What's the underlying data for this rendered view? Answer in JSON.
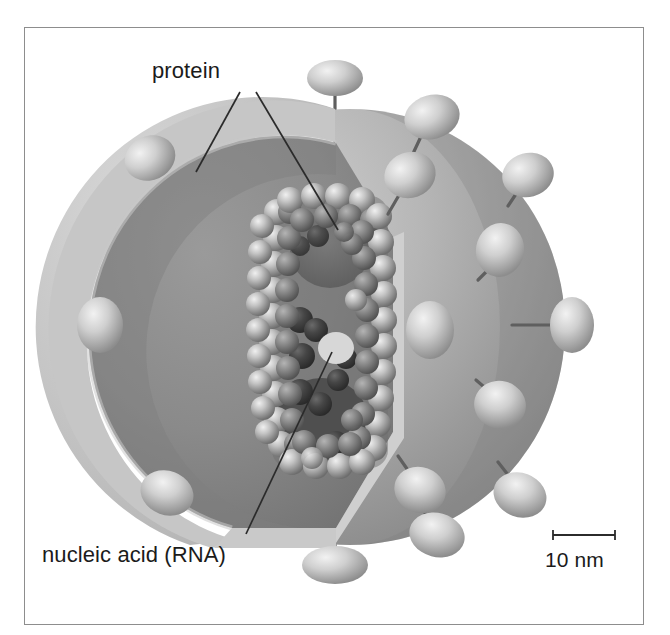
{
  "figure": {
    "background_color": "#ffffff",
    "frame_color": "#8d8d8d"
  },
  "labels": {
    "protein": "protein",
    "nucleic_acid": "nucleic acid (RNA)",
    "scale_bar": "10 nm"
  },
  "palette": {
    "envelope_light": "#c2c2c2",
    "envelope_shadow": "#9a9a9a",
    "outer_sphere_light": "#c9c9c9",
    "outer_sphere_dark": "#8f8f8f",
    "inner_cavity": "#8c8c8c",
    "inner_cavity_dark": "#6e6e6e",
    "capsid_sphere_light": "#e3e3e3",
    "capsid_sphere_dark": "#6a6a6a",
    "rna_dark": "#3d3d3d",
    "spike_light": "#ececec",
    "spike_dark": "#8a8a8a",
    "stalk": "#5a5a5a",
    "leader_line": "#2b2b2b",
    "text": "#1b1b1b"
  },
  "structure": {
    "parts": [
      "lipid envelope",
      "matrix / inner membrane layer",
      "helical nucleocapsid (protein subunits)",
      "nucleic acid (RNA) strand",
      "surface glycoprotein spikes"
    ],
    "cutaway": "quarter wedge removed from front-left to reveal interior"
  },
  "scale": {
    "bar_label": "10 nm",
    "bar_length_px": 62,
    "tick_height_px": 9
  },
  "spikes": [
    {
      "id": "spike-top",
      "cx": 335,
      "cy": 78,
      "rx": 28,
      "ry": 18,
      "angle": 0,
      "stalk_x2": 335,
      "stalk_y2": 150
    },
    {
      "id": "spike-upper-left",
      "cx": 150,
      "cy": 158,
      "rx": 26,
      "ry": 22,
      "angle": -25,
      "stalk_x2": 198,
      "stalk_y2": 196
    },
    {
      "id": "spike-upper-right",
      "cx": 432,
      "cy": 117,
      "rx": 28,
      "ry": 22,
      "angle": -15,
      "stalk_x2": 418,
      "stalk_y2": 162
    },
    {
      "id": "spike-ur2",
      "cx": 410,
      "cy": 175,
      "rx": 26,
      "ry": 23,
      "angle": -20,
      "stalk_x2": 392,
      "stalk_y2": 212
    },
    {
      "id": "spike-right-top",
      "cx": 528,
      "cy": 175,
      "rx": 26,
      "ry": 22,
      "angle": -15,
      "stalk_x2": 511,
      "stalk_y2": 190
    },
    {
      "id": "spike-right-mid",
      "cx": 500,
      "cy": 250,
      "rx": 24,
      "ry": 27,
      "angle": 10,
      "stalk_x2": 481,
      "stalk_y2": 263
    },
    {
      "id": "spike-far-right",
      "cx": 572,
      "cy": 325,
      "rx": 22,
      "ry": 28,
      "angle": 0,
      "stalk_x2": 528,
      "stalk_y2": 325
    },
    {
      "id": "spike-left",
      "cx": 100,
      "cy": 325,
      "rx": 23,
      "ry": 28,
      "angle": 0,
      "stalk_x2": 155,
      "stalk_y2": 325
    },
    {
      "id": "spike-center-face",
      "cx": 430,
      "cy": 330,
      "rx": 24,
      "ry": 29,
      "angle": 0,
      "stalk_x2": 430,
      "stalk_y2": 330
    },
    {
      "id": "spike-right-low",
      "cx": 500,
      "cy": 405,
      "rx": 26,
      "ry": 24,
      "angle": 15,
      "stalk_x2": 478,
      "stalk_y2": 394
    },
    {
      "id": "spike-lower-left",
      "cx": 167,
      "cy": 493,
      "rx": 27,
      "ry": 22,
      "angle": 20,
      "stalk_x2": 198,
      "stalk_y2": 460
    },
    {
      "id": "spike-lower-right",
      "cx": 420,
      "cy": 490,
      "rx": 26,
      "ry": 23,
      "angle": 20,
      "stalk_x2": 400,
      "stalk_y2": 460
    },
    {
      "id": "spike-bottom-right",
      "cx": 437,
      "cy": 535,
      "rx": 28,
      "ry": 22,
      "angle": 15,
      "stalk_x2": 420,
      "stalk_y2": 508
    },
    {
      "id": "spike-br-far",
      "cx": 520,
      "cy": 495,
      "rx": 27,
      "ry": 22,
      "angle": 20,
      "stalk_x2": 500,
      "stalk_y2": 470
    },
    {
      "id": "spike-bottom",
      "cx": 335,
      "cy": 565,
      "rx": 33,
      "ry": 19,
      "angle": 0,
      "stalk_x2": 335,
      "stalk_y2": 500
    }
  ],
  "leader_lines": [
    {
      "id": "leader-protein-envelope",
      "x1": 240,
      "y1": 92,
      "x2": 196,
      "y2": 170
    },
    {
      "id": "leader-protein-capsid",
      "x1": 256,
      "y1": 92,
      "x2": 336,
      "y2": 228
    },
    {
      "id": "leader-rna",
      "x1": 246,
      "y1": 534,
      "x2": 330,
      "y2": 355
    }
  ]
}
